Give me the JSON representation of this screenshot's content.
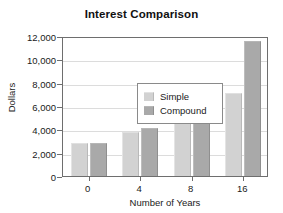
{
  "chart_data": {
    "type": "bar",
    "title": "Interest Comparison",
    "xlabel": "Number of Years",
    "ylabel": "Dollars",
    "categories": [
      "0",
      "4",
      "8",
      "16"
    ],
    "series": [
      {
        "name": "Simple",
        "color": "#d2d2d2",
        "values": [
          2800,
          3800,
          4800,
          7100
        ]
      },
      {
        "name": "Compound",
        "color": "#a9a9a9",
        "values": [
          2850,
          4100,
          5900,
          11600
        ]
      }
    ],
    "ylim": [
      0,
      12000
    ],
    "ytick_values": [
      0,
      2000,
      4000,
      6000,
      8000,
      10000,
      12000
    ],
    "ytick_labels": [
      "0",
      "2,000",
      "4,000",
      "6,000",
      "8,000",
      "10,000",
      "12,000"
    ],
    "grid": "horizontal",
    "legend_position": "upper-left-inside",
    "legend_entries": [
      "Simple",
      "Compound"
    ]
  }
}
